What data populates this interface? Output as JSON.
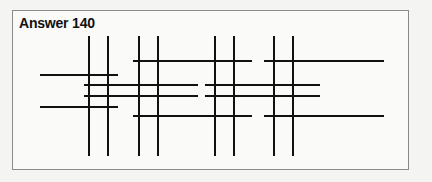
{
  "title": "Answer 140",
  "colors": {
    "line": "#111111",
    "border": "#8a8a8a",
    "background": "#fafaf8"
  },
  "diagram": {
    "vertical_lines": [
      {
        "x": 89,
        "y1": 36,
        "y2": 156
      },
      {
        "x": 108,
        "y1": 36,
        "y2": 156
      },
      {
        "x": 139,
        "y1": 36,
        "y2": 156
      },
      {
        "x": 158,
        "y1": 36,
        "y2": 156
      },
      {
        "x": 215,
        "y1": 36,
        "y2": 156
      },
      {
        "x": 234,
        "y1": 36,
        "y2": 156
      },
      {
        "x": 274,
        "y1": 36,
        "y2": 156
      },
      {
        "x": 293,
        "y1": 36,
        "y2": 156
      }
    ],
    "horizontal_lines": [
      {
        "y": 61,
        "x1": 133,
        "x2": 252
      },
      {
        "y": 61,
        "x1": 264,
        "x2": 384
      },
      {
        "y": 75,
        "x1": 40,
        "x2": 118
      },
      {
        "y": 85,
        "x1": 84,
        "x2": 198
      },
      {
        "y": 85,
        "x1": 205,
        "x2": 320
      },
      {
        "y": 96,
        "x1": 84,
        "x2": 198
      },
      {
        "y": 96,
        "x1": 205,
        "x2": 320
      },
      {
        "y": 107,
        "x1": 40,
        "x2": 118
      },
      {
        "y": 116,
        "x1": 133,
        "x2": 252
      },
      {
        "y": 116,
        "x1": 264,
        "x2": 384
      }
    ]
  }
}
